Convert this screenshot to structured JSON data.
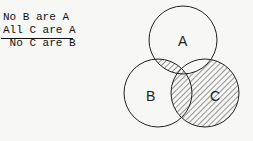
{
  "syllogism": {
    "premise1": "No B are A",
    "premise2": "All C are A",
    "conclusion": " No C are B"
  },
  "venn": {
    "circles": [
      {
        "label": "A",
        "cx": 183,
        "cy": 40,
        "r": 34
      },
      {
        "label": "B",
        "cx": 158,
        "cy": 93,
        "r": 34
      },
      {
        "label": "C",
        "cx": 205,
        "cy": 93,
        "r": 34
      }
    ],
    "shaded_regions": [
      "A∩B",
      "C−A",
      "A∩B∩C"
    ],
    "stroke_color": "#222222"
  }
}
